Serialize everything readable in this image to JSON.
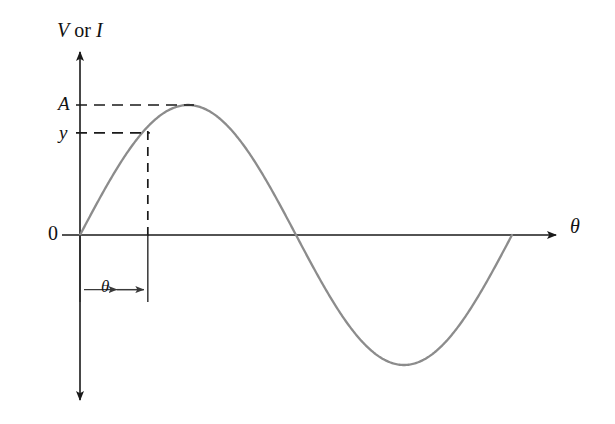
{
  "figure": {
    "background": "#ffffff",
    "axis_color": "#1a1a1a",
    "curve_color": "#8c8c8c",
    "dash_color": "#1a1a1a"
  },
  "labels": {
    "vertical_axis_v": "V",
    "vertical_axis_or": " or ",
    "vertical_axis_i": "I",
    "amplitude": "A",
    "instantaneous_value": "y",
    "origin": "0",
    "horizontal_axis": "θ",
    "angle_dimension": "θ"
  },
  "chart_data": {
    "type": "line",
    "title": "",
    "xlabel": "θ",
    "ylabel": "V or I",
    "grid": false,
    "legend": null,
    "xlim": [
      -0.05,
      1.12
    ],
    "ylim": [
      -1.35,
      1.35
    ],
    "axis_ticks": {
      "x": [],
      "y": [
        "A",
        "y",
        "0"
      ]
    },
    "annotations": [
      {
        "name": "amplitude-line",
        "label": "A",
        "y_value": 1.0,
        "style": "dashed",
        "from_x": 0.0,
        "to_x": 0.25
      },
      {
        "name": "instantaneous-line",
        "label": "y",
        "y_value": 0.785,
        "style": "dashed",
        "from_x": 0.0,
        "to_x": 0.157
      },
      {
        "name": "angle-dropline",
        "label": "",
        "x_value": 0.157,
        "style": "dashed",
        "from_y": 0.785,
        "to_y": 0.0
      },
      {
        "name": "angle-dimension",
        "label": "θ",
        "from_x": 0.0,
        "to_x": 0.157,
        "at_y": -0.42
      }
    ],
    "series": [
      {
        "name": "sine wave",
        "equation": "y = A sin(θ)",
        "amplitude": 1.0,
        "period": 1.0,
        "phase": 0.0,
        "x": [
          0.0,
          0.05,
          0.1,
          0.125,
          0.157,
          0.2,
          0.25,
          0.3,
          0.35,
          0.4,
          0.45,
          0.5,
          0.55,
          0.6,
          0.65,
          0.7,
          0.75,
          0.8,
          0.85,
          0.9,
          0.95,
          1.0
        ],
        "y": [
          0.0,
          0.309,
          0.588,
          0.707,
          0.823,
          0.951,
          1.0,
          0.951,
          0.809,
          0.588,
          0.309,
          0.0,
          -0.309,
          -0.588,
          -0.809,
          -0.951,
          -1.0,
          -0.951,
          -0.809,
          -0.588,
          -0.309,
          0.0
        ]
      }
    ]
  }
}
